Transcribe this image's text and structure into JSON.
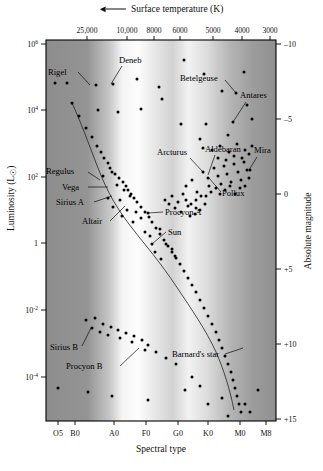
{
  "figure": {
    "type": "hr-diagram",
    "top_axis": {
      "title": "Surface temperature (K)",
      "arrow": "◄",
      "arrow_direction": "left",
      "ticks": [
        {
          "label": "25,000",
          "x": 87
        },
        {
          "label": "10,000",
          "x": 127
        },
        {
          "label": "8000",
          "x": 154
        },
        {
          "label": "6000",
          "x": 180
        },
        {
          "label": "5000",
          "x": 213
        },
        {
          "label": "4000",
          "x": 242
        },
        {
          "label": "3000",
          "x": 270
        }
      ]
    },
    "bottom_axis": {
      "title": "Spectral type",
      "ticks": [
        {
          "label": "O5",
          "x": 58
        },
        {
          "label": "B0",
          "x": 75
        },
        {
          "label": "A0",
          "x": 114
        },
        {
          "label": "F0",
          "x": 146
        },
        {
          "label": "G0",
          "x": 178
        },
        {
          "label": "K0",
          "x": 208
        },
        {
          "label": "M0",
          "x": 240
        },
        {
          "label": "M8",
          "x": 266
        }
      ]
    },
    "left_axis": {
      "title": "Luminosity (L",
      "title_sun": "☉",
      "title_close": ")",
      "ticks": [
        {
          "base": "10",
          "exp": "6",
          "y": 44
        },
        {
          "base": "10",
          "exp": "4",
          "y": 110
        },
        {
          "base": "10",
          "exp": "2",
          "y": 177
        },
        {
          "base": "1",
          "exp": "",
          "y": 243
        },
        {
          "base": "10",
          "exp": "-2",
          "y": 310
        },
        {
          "base": "10",
          "exp": "-4",
          "y": 377
        }
      ]
    },
    "right_axis": {
      "title": "Absolute magnitude",
      "ticks": [
        {
          "label": "–10",
          "y": 44
        },
        {
          "label": "–5",
          "y": 119
        },
        {
          "label": "0",
          "y": 194
        },
        {
          "label": "+5",
          "y": 269
        },
        {
          "label": "+10",
          "y": 344
        },
        {
          "label": "+15",
          "y": 419
        }
      ]
    },
    "plot_area": {
      "x": 46,
      "y": 40,
      "width": 230,
      "height": 381
    },
    "background_bands": [
      {
        "offset": 0.0,
        "color": "#8d8d8d"
      },
      {
        "offset": 0.18,
        "color": "#949494"
      },
      {
        "offset": 0.28,
        "color": "#c9c9c9"
      },
      {
        "offset": 0.33,
        "color": "#f4f4f4"
      },
      {
        "offset": 0.4,
        "color": "#fdfdfd"
      },
      {
        "offset": 0.47,
        "color": "#e8e8e8"
      },
      {
        "offset": 0.55,
        "color": "#d2d2d2"
      },
      {
        "offset": 0.62,
        "color": "#f2f2f2"
      },
      {
        "offset": 0.7,
        "color": "#dcdcdc"
      },
      {
        "offset": 0.8,
        "color": "#b5b5b5"
      },
      {
        "offset": 0.9,
        "color": "#9c9c9c"
      },
      {
        "offset": 1.0,
        "color": "#909090"
      }
    ],
    "star_labels": [
      {
        "name": "Rigel",
        "tx": 48,
        "ty": 75,
        "anchor": "start",
        "lx1": 78,
        "ly1": 72,
        "lx2": 90,
        "ly2": 85
      },
      {
        "name": "Deneb",
        "tx": 119,
        "ty": 63,
        "anchor": "start",
        "lx1": 122,
        "ly1": 66,
        "lx2": 111,
        "ly2": 84
      },
      {
        "name": "Betelgeuse",
        "tx": 180,
        "ty": 81,
        "anchor": "start",
        "lx1": 225,
        "ly1": 80,
        "lx2": 236,
        "ly2": 93
      },
      {
        "name": "Antares",
        "tx": 240,
        "ty": 98,
        "anchor": "start",
        "lx1": 246,
        "ly1": 102,
        "lx2": 233,
        "ly2": 122
      },
      {
        "name": "Arcturus",
        "tx": 157,
        "ty": 155,
        "anchor": "start",
        "lx1": 190,
        "ly1": 158,
        "lx2": 203,
        "ly2": 172
      },
      {
        "name": "Aldebaran",
        "tx": 205,
        "ty": 152,
        "anchor": "start",
        "lx1": 215,
        "ly1": 155,
        "lx2": 208,
        "ly2": 175
      },
      {
        "name": "Mira",
        "tx": 254,
        "ty": 153,
        "anchor": "start",
        "lx1": 257,
        "ly1": 157,
        "lx2": 249,
        "ly2": 170
      },
      {
        "name": "Pollux",
        "tx": 222,
        "ty": 196,
        "anchor": "start",
        "lx1": 221,
        "ly1": 192,
        "lx2": 209,
        "ly2": 178
      },
      {
        "name": "Regulus",
        "tx": 46,
        "ty": 174,
        "anchor": "start",
        "lx1": 88,
        "ly1": 172,
        "lx2": 100,
        "ly2": 180
      },
      {
        "name": "Vega",
        "tx": 62,
        "ty": 190,
        "anchor": "start",
        "lx1": 88,
        "ly1": 187,
        "lx2": 108,
        "ly2": 187
      },
      {
        "name": "Sirius A",
        "tx": 56,
        "ty": 205,
        "anchor": "start",
        "lx1": 94,
        "ly1": 202,
        "lx2": 112,
        "ly2": 196
      },
      {
        "name": "Altair",
        "tx": 82,
        "ty": 224,
        "anchor": "start",
        "lx1": 110,
        "ly1": 221,
        "lx2": 125,
        "ly2": 206
      },
      {
        "name": "Procyon A",
        "tx": 165,
        "ty": 215,
        "anchor": "start",
        "lx1": 163,
        "ly1": 212,
        "lx2": 148,
        "ly2": 213
      },
      {
        "name": "Sun",
        "tx": 168,
        "ty": 235,
        "anchor": "start",
        "lx1": 166,
        "ly1": 232,
        "lx2": 152,
        "ly2": 244
      },
      {
        "name": "Sirius B",
        "tx": 50,
        "ty": 350,
        "anchor": "start",
        "lx1": 82,
        "ly1": 346,
        "lx2": 91,
        "ly2": 328
      },
      {
        "name": "Procyon B",
        "tx": 66,
        "ty": 369,
        "anchor": "start",
        "lx1": 120,
        "ly1": 366,
        "lx2": 139,
        "ly2": 348
      },
      {
        "name": "Barnard's star",
        "tx": 172,
        "ty": 357,
        "anchor": "start",
        "lx1": 225,
        "ly1": 354,
        "lx2": 243,
        "ly2": 348
      }
    ],
    "main_sequence_path": "M72,103 C80,120 88,142 98,168 C108,194 118,210 132,228 C146,246 160,262 176,286 C192,310 206,330 216,352 C224,370 230,390 234,410",
    "giant_branch_path": "",
    "stars": [
      [
        55,
        83
      ],
      [
        67,
        83
      ],
      [
        96,
        85
      ],
      [
        113,
        84
      ],
      [
        137,
        79
      ],
      [
        159,
        87
      ],
      [
        184,
        60
      ],
      [
        204,
        74
      ],
      [
        222,
        91
      ],
      [
        244,
        72
      ],
      [
        236,
        93
      ],
      [
        233,
        122
      ],
      [
        247,
        105
      ],
      [
        98,
        110
      ],
      [
        118,
        112
      ],
      [
        141,
        109
      ],
      [
        162,
        99
      ],
      [
        181,
        124
      ],
      [
        206,
        124
      ],
      [
        200,
        139
      ],
      [
        228,
        135
      ],
      [
        252,
        119
      ],
      [
        72,
        103
      ],
      [
        79,
        116
      ],
      [
        86,
        128
      ],
      [
        92,
        137
      ],
      [
        97,
        146
      ],
      [
        101,
        152
      ],
      [
        104,
        158
      ],
      [
        108,
        163
      ],
      [
        110,
        168
      ],
      [
        115,
        174
      ],
      [
        119,
        178
      ],
      [
        123,
        182
      ],
      [
        126,
        186
      ],
      [
        128,
        190
      ],
      [
        131,
        194
      ],
      [
        134,
        198
      ],
      [
        137,
        202
      ],
      [
        141,
        207
      ],
      [
        145,
        212
      ],
      [
        149,
        217
      ],
      [
        152,
        222
      ],
      [
        156,
        228
      ],
      [
        160,
        234
      ],
      [
        164,
        240
      ],
      [
        168,
        246
      ],
      [
        172,
        252
      ],
      [
        176,
        258
      ],
      [
        180,
        264
      ],
      [
        184,
        271
      ],
      [
        188,
        278
      ],
      [
        192,
        285
      ],
      [
        196,
        292
      ],
      [
        200,
        300
      ],
      [
        204,
        308
      ],
      [
        208,
        316
      ],
      [
        212,
        324
      ],
      [
        216,
        332
      ],
      [
        219,
        340
      ],
      [
        222,
        348
      ],
      [
        225,
        356
      ],
      [
        228,
        364
      ],
      [
        231,
        372
      ],
      [
        233,
        380
      ],
      [
        235,
        388
      ],
      [
        237,
        396
      ],
      [
        239,
        404
      ],
      [
        241,
        412
      ],
      [
        103,
        176
      ],
      [
        112,
        172
      ],
      [
        117,
        185
      ],
      [
        124,
        190
      ],
      [
        108,
        198
      ],
      [
        120,
        200
      ],
      [
        130,
        196
      ],
      [
        113,
        207
      ],
      [
        127,
        210
      ],
      [
        136,
        212
      ],
      [
        122,
        216
      ],
      [
        133,
        222
      ],
      [
        141,
        218
      ],
      [
        148,
        213
      ],
      [
        152,
        244
      ],
      [
        160,
        229
      ],
      [
        145,
        232
      ],
      [
        155,
        252
      ],
      [
        150,
        236
      ],
      [
        166,
        244
      ],
      [
        172,
        249
      ],
      [
        175,
        256
      ],
      [
        161,
        259
      ],
      [
        186,
        186
      ],
      [
        192,
        180
      ],
      [
        197,
        192
      ],
      [
        203,
        172
      ],
      [
        208,
        178
      ],
      [
        209,
        186
      ],
      [
        214,
        168
      ],
      [
        218,
        176
      ],
      [
        221,
        184
      ],
      [
        224,
        166
      ],
      [
        227,
        174
      ],
      [
        231,
        182
      ],
      [
        234,
        164
      ],
      [
        238,
        172
      ],
      [
        241,
        180
      ],
      [
        244,
        162
      ],
      [
        247,
        170
      ],
      [
        249,
        178
      ],
      [
        196,
        200
      ],
      [
        201,
        196
      ],
      [
        206,
        196
      ],
      [
        211,
        192
      ],
      [
        216,
        188
      ],
      [
        220,
        194
      ],
      [
        225,
        190
      ],
      [
        230,
        186
      ],
      [
        235,
        194
      ],
      [
        240,
        188
      ],
      [
        245,
        186
      ],
      [
        250,
        170
      ],
      [
        172,
        196
      ],
      [
        178,
        202
      ],
      [
        183,
        194
      ],
      [
        188,
        206
      ],
      [
        175,
        208
      ],
      [
        181,
        212
      ],
      [
        186,
        200
      ],
      [
        191,
        204
      ],
      [
        196,
        208
      ],
      [
        169,
        204
      ],
      [
        165,
        200
      ],
      [
        190,
        216
      ],
      [
        195,
        214
      ],
      [
        200,
        210
      ],
      [
        205,
        204
      ],
      [
        203,
        148
      ],
      [
        212,
        150
      ],
      [
        220,
        146
      ],
      [
        229,
        152
      ],
      [
        237,
        144
      ],
      [
        245,
        150
      ],
      [
        252,
        146
      ],
      [
        218,
        158
      ],
      [
        226,
        160
      ],
      [
        234,
        156
      ],
      [
        242,
        158
      ],
      [
        249,
        154
      ],
      [
        86,
        320
      ],
      [
        95,
        318
      ],
      [
        103,
        324
      ],
      [
        111,
        327
      ],
      [
        118,
        330
      ],
      [
        126,
        333
      ],
      [
        134,
        336
      ],
      [
        142,
        340
      ],
      [
        148,
        345
      ],
      [
        156,
        352
      ],
      [
        166,
        358
      ],
      [
        176,
        364
      ],
      [
        192,
        377
      ],
      [
        92,
        328
      ],
      [
        100,
        332
      ],
      [
        108,
        335
      ],
      [
        120,
        338
      ],
      [
        132,
        342
      ],
      [
        145,
        350
      ],
      [
        58,
        388
      ],
      [
        88,
        392
      ],
      [
        112,
        396
      ],
      [
        148,
        400
      ],
      [
        208,
        404
      ],
      [
        258,
        390
      ],
      [
        185,
        390
      ],
      [
        200,
        386
      ],
      [
        222,
        398
      ],
      [
        245,
        404
      ],
      [
        250,
        412
      ],
      [
        228,
        416
      ]
    ]
  }
}
